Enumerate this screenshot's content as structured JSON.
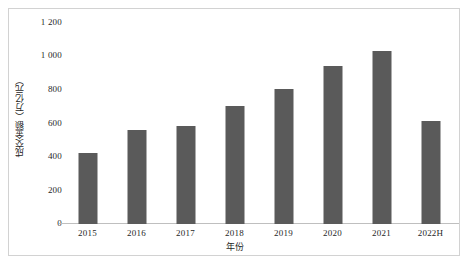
{
  "chart_data": {
    "type": "bar",
    "title": "",
    "subtitle": "",
    "xlabel": "年份",
    "ylabel": "成交金额（万亿元）",
    "categories": [
      "2015",
      "2016",
      "2017",
      "2018",
      "2019",
      "2020",
      "2021",
      "2022H"
    ],
    "values": [
      420,
      560,
      580,
      700,
      800,
      940,
      1030,
      615
    ],
    "series": [
      {
        "name": "成交金额",
        "values": [
          420,
          560,
          580,
          700,
          800,
          940,
          1030,
          615
        ]
      }
    ],
    "ylim": [
      0,
      1200
    ],
    "y_ticks": [
      0,
      200,
      400,
      600,
      800,
      1000,
      1200
    ],
    "y_tick_labels": [
      "0",
      "200",
      "400",
      "600",
      "800",
      "1 000",
      "1 200"
    ],
    "grid": false,
    "legend": "none",
    "bar_color": "#5a5a5a",
    "axis_color": "#bfbfbf",
    "frame_color": "#d2d2d2",
    "text_color": "#1f1f1f"
  }
}
